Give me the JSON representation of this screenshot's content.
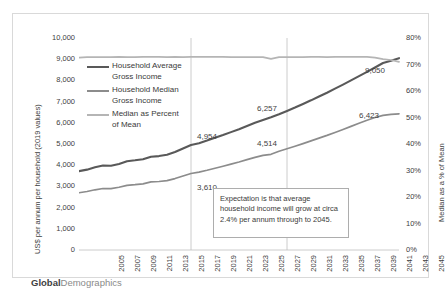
{
  "chart_data": {
    "type": "line",
    "title": "",
    "xlabel": "",
    "ylabel": "US$ per annum per household (2019 values)",
    "y2label": "Median as a % of Mean",
    "ylim": [
      0,
      10000
    ],
    "y2lim": [
      0,
      0.8
    ],
    "grid": "vertical-sparse",
    "legend_position": "inside-upper-left",
    "x": [
      2005,
      2006,
      2007,
      2008,
      2009,
      2010,
      2011,
      2012,
      2013,
      2014,
      2015,
      2016,
      2017,
      2018,
      2019,
      2020,
      2021,
      2022,
      2023,
      2024,
      2025,
      2026,
      2027,
      2028,
      2029,
      2030,
      2031,
      2032,
      2033,
      2034,
      2035,
      2036,
      2037,
      2038,
      2039,
      2040,
      2041,
      2042,
      2043,
      2044,
      2045
    ],
    "x_tick_labels": [
      "2005",
      "2007",
      "2009",
      "2011",
      "2013",
      "2015",
      "2017",
      "2019",
      "2021",
      "2023",
      "2025",
      "2027",
      "2029",
      "2031",
      "2033",
      "2035",
      "2037",
      "2039",
      "2041",
      "2043",
      "2045"
    ],
    "y_left_tick_labels": [
      "10,000",
      "9,000",
      "8,000",
      "7,000",
      "6,000",
      "5,000",
      "4,000",
      "3,000",
      "2,000",
      "1,000",
      "0"
    ],
    "y_right_tick_labels": [
      "80%",
      "70%",
      "60%",
      "50%",
      "40%",
      "30%",
      "20%",
      "10%",
      "0%"
    ],
    "series": [
      {
        "name": "Household Average Gross Income",
        "axis": "left",
        "color": "#595959",
        "width": 2.1,
        "values": [
          3720,
          3790,
          3900,
          3985,
          3975,
          4060,
          4190,
          4230,
          4280,
          4400,
          4430,
          4490,
          4620,
          4790,
          4954,
          5040,
          5160,
          5290,
          5420,
          5560,
          5700,
          5850,
          6000,
          6130,
          6257,
          6400,
          6560,
          6720,
          6890,
          7060,
          7240,
          7420,
          7610,
          7800,
          8000,
          8200,
          8400,
          8610,
          8820,
          8930,
          9050
        ]
      },
      {
        "name": "Household Median Gross Income",
        "axis": "left",
        "color": "#8c8c8c",
        "width": 1.7,
        "values": [
          2700,
          2760,
          2840,
          2900,
          2895,
          2960,
          3050,
          3080,
          3120,
          3210,
          3230,
          3270,
          3370,
          3490,
          3610,
          3675,
          3760,
          3855,
          3950,
          4050,
          4150,
          4260,
          4370,
          4465,
          4514,
          4660,
          4775,
          4895,
          5020,
          5145,
          5275,
          5405,
          5545,
          5685,
          5830,
          5975,
          6120,
          6250,
          6350,
          6400,
          6423
        ]
      },
      {
        "name": "Median as Percent of Mean",
        "axis": "right",
        "color": "#b5b5b5",
        "width": 1.7,
        "values": [
          0.726,
          0.728,
          0.728,
          0.728,
          0.728,
          0.729,
          0.728,
          0.728,
          0.729,
          0.729,
          0.729,
          0.728,
          0.729,
          0.728,
          0.729,
          0.729,
          0.729,
          0.729,
          0.729,
          0.728,
          0.728,
          0.728,
          0.728,
          0.728,
          0.721,
          0.728,
          0.728,
          0.728,
          0.728,
          0.729,
          0.729,
          0.728,
          0.729,
          0.729,
          0.729,
          0.729,
          0.729,
          0.726,
          0.72,
          0.717,
          0.71
        ]
      }
    ],
    "data_labels": [
      {
        "text": "4,954",
        "series": "Household Average Gross Income",
        "x": 2019
      },
      {
        "text": "3,610",
        "series": "Household Median Gross Income",
        "x": 2019
      },
      {
        "text": "6,257",
        "series": "Household Average Gross Income",
        "x": 2029
      },
      {
        "text": "4,514",
        "series": "Household Median Gross Income",
        "x": 2029
      },
      {
        "text": "9,050",
        "series": "Household Average Gross Income",
        "x": 2045
      },
      {
        "text": "6,423",
        "series": "Household Median Gross Income",
        "x": 2045
      }
    ],
    "gridlines_x": [
      2019,
      2031
    ],
    "annotation": "Expectation is that average household income will grow at circa 2.4% per annum through to 2045."
  },
  "legend": {
    "items": [
      {
        "label_line1": "Household Average",
        "label_line2": "Gross Income",
        "color": "#595959"
      },
      {
        "label_line1": "Household Median",
        "label_line2": "Gross Income",
        "color": "#8c8c8c"
      },
      {
        "label_line1": "Median as Percent",
        "label_line2": "of Mean",
        "color": "#b5b5b5"
      }
    ]
  },
  "footer": {
    "brand_bold": "Global",
    "brand_light": "Demographics"
  }
}
